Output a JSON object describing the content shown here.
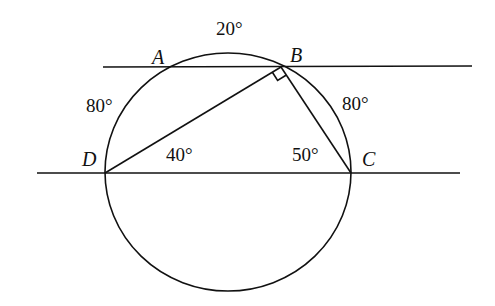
{
  "diagram": {
    "type": "geometry-circle-parallel-lines",
    "points": {
      "A": {
        "label": "A",
        "x": 171,
        "y": 67
      },
      "B": {
        "label": "B",
        "x": 281,
        "y": 67
      },
      "C": {
        "label": "C",
        "x": 351,
        "y": 173
      },
      "D": {
        "label": "D",
        "x": 105,
        "y": 173
      }
    },
    "circle": {
      "cx": 228,
      "cy": 172,
      "rx": 123,
      "ry": 119
    },
    "lines": {
      "top": {
        "x1": 103,
        "y1": 67,
        "x2": 472,
        "y2": 66
      },
      "bottom": {
        "x1": 37,
        "y1": 173,
        "x2": 460,
        "y2": 173
      }
    },
    "segments": [
      "BD",
      "BC"
    ],
    "right_angle_at": "B",
    "arc_labels": {
      "AB": "20°",
      "AD": "80°",
      "BC": "80°"
    },
    "angle_labels": {
      "BDC": "40°",
      "BCD": "50°"
    }
  }
}
